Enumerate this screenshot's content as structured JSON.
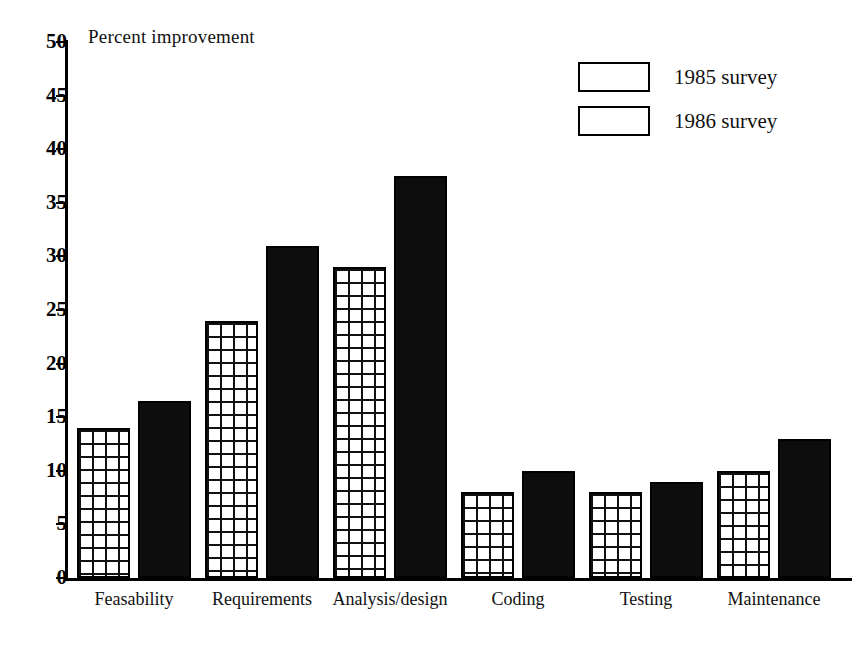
{
  "chart_data": {
    "type": "bar",
    "title": "",
    "ylabel": "Percent improvement",
    "xlabel": "",
    "ylim": [
      0,
      50
    ],
    "ytick_step": 5,
    "yticks": [
      "50",
      "45",
      "40",
      "35",
      "30",
      "25",
      "20",
      "15",
      "10",
      "5",
      "0"
    ],
    "grid": false,
    "legend_position": "top-right",
    "categories": [
      "Feasability",
      "Requirements",
      "Analysis/design",
      "Coding",
      "Testing",
      "Maintenance"
    ],
    "series": [
      {
        "name": "1985 survey",
        "values": [
          14,
          24,
          29,
          8,
          8,
          10
        ]
      },
      {
        "name": "1986 survey",
        "values": [
          16.5,
          31,
          37.5,
          10,
          9,
          13
        ]
      }
    ]
  },
  "legend": {
    "items": [
      {
        "label": "1985 survey",
        "pattern": "white-grid"
      },
      {
        "label": "1986 survey",
        "pattern": "black-grid"
      }
    ]
  },
  "colors": {
    "ink": "#000000",
    "background": "#ffffff",
    "series_1985_fill": "#ffffff",
    "series_1985_line": "#111111",
    "series_1986_fill": "#0d0d0d",
    "series_1986_line": "#ffffff"
  }
}
